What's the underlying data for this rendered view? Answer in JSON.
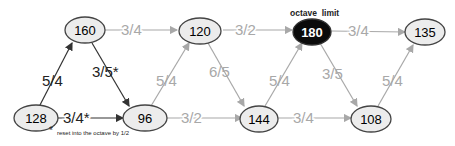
{
  "title_annotation": "octave  limit",
  "footnote": "reset into the octave by 1/2",
  "footnote_marker": "*",
  "nodes": [
    {
      "id": "n128",
      "label": "128"
    },
    {
      "id": "n160",
      "label": "160"
    },
    {
      "id": "n96",
      "label": "96"
    },
    {
      "id": "n120",
      "label": "120"
    },
    {
      "id": "n144",
      "label": "144"
    },
    {
      "id": "n180",
      "label": "180"
    },
    {
      "id": "n108",
      "label": "108"
    },
    {
      "id": "n135",
      "label": "135"
    }
  ],
  "edges": [
    {
      "from": "128",
      "to": "160",
      "label": "5/4"
    },
    {
      "from": "160",
      "to": "96",
      "label": "3/5*"
    },
    {
      "from": "128",
      "to": "96",
      "label": "3/4*"
    },
    {
      "from": "160",
      "to": "120",
      "label": "3/4"
    },
    {
      "from": "96",
      "to": "120",
      "label": "5/4"
    },
    {
      "from": "96",
      "to": "144",
      "label": "3/2"
    },
    {
      "from": "120",
      "to": "180",
      "label": "3/2"
    },
    {
      "from": "120",
      "to": "144",
      "label": "6/5"
    },
    {
      "from": "144",
      "to": "180",
      "label": "5/4"
    },
    {
      "from": "144",
      "to": "108",
      "label": "3/4"
    },
    {
      "from": "180",
      "to": "135",
      "label": "3/4"
    },
    {
      "from": "180",
      "to": "108",
      "label": "3/5"
    },
    {
      "from": "108",
      "to": "135",
      "label": "5/4"
    }
  ]
}
